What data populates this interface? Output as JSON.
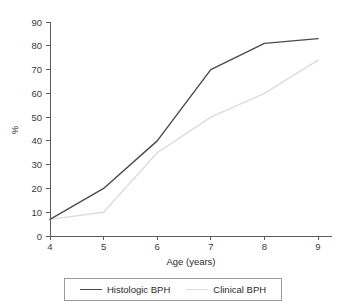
{
  "chart_data": {
    "type": "line",
    "title": "",
    "xlabel": "Age (years)",
    "ylabel": "%",
    "x": [
      4,
      5,
      6,
      7,
      8,
      9
    ],
    "xtick_labels": [
      "4",
      "5",
      "6",
      "7",
      "8",
      "9"
    ],
    "ytick_labels": [
      "0",
      "10",
      "20",
      "30",
      "40",
      "50",
      "60",
      "70",
      "80",
      "90"
    ],
    "xlim": [
      4,
      9
    ],
    "ylim": [
      0,
      90
    ],
    "grid": false,
    "legend_position": "bottom",
    "series": [
      {
        "name": "Histologic BPH",
        "color": "#4a4a52",
        "values": [
          7,
          20,
          40,
          70,
          81,
          83
        ]
      },
      {
        "name": "Clinical BPH",
        "color": "#dcdcdc",
        "values": [
          7,
          10,
          35,
          50,
          60,
          74
        ]
      }
    ]
  },
  "legend": {
    "entries": [
      {
        "label": "Histologic BPH"
      },
      {
        "label": "Clinical BPH"
      }
    ]
  },
  "axes": {
    "x_title": "Age (years)",
    "y_title": "%"
  }
}
